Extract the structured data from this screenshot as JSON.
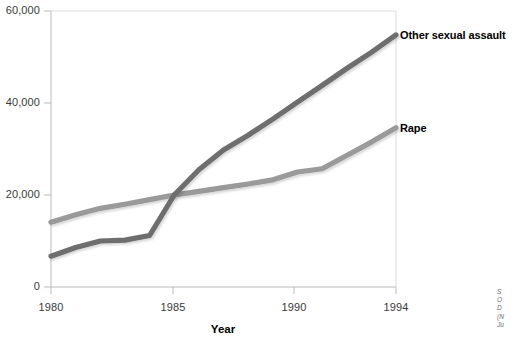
{
  "chart_data": {
    "type": "line",
    "title": "",
    "xlabel": "Year",
    "ylabel": "",
    "xlim": [
      1980,
      1994
    ],
    "ylim": [
      0,
      60000
    ],
    "grid": false,
    "legend_position": "right-inline",
    "x": [
      1980,
      1981,
      1982,
      1983,
      1984,
      1985,
      1986,
      1987,
      1988,
      1989,
      1990,
      1991,
      1992,
      1993,
      1994
    ],
    "xticks": [
      "1980",
      "1985",
      "1990",
      "1994"
    ],
    "xtick_values": [
      1980,
      1985,
      1990,
      1994
    ],
    "yticks": [
      "0",
      "20,000",
      "40,000",
      "60,000"
    ],
    "ytick_values": [
      0,
      20000,
      40000,
      60000
    ],
    "series": [
      {
        "name": "Other sexual assault",
        "color": "#6e6e6e",
        "values": [
          6700,
          8600,
          10000,
          10200,
          11200,
          20000,
          25500,
          29800,
          33000,
          36500,
          40200,
          43800,
          47500,
          51000,
          54800
        ]
      },
      {
        "name": "Rape",
        "color": "#9a9a9a",
        "values": [
          14100,
          15700,
          17100,
          18000,
          19000,
          20000,
          20800,
          21600,
          22400,
          23300,
          25000,
          25700,
          28600,
          31500,
          34600
        ]
      }
    ]
  },
  "labels": {
    "series_other_sexual_assault": "Other sexual assault",
    "series_rape": "Rape",
    "x_axis_title": "Year",
    "ytick_0": "0",
    "ytick_20000": "20,000",
    "ytick_40000": "40,000",
    "ytick_60000": "60,000",
    "xtick_1980": "1980",
    "xtick_1985": "1985",
    "xtick_1990": "1990",
    "xtick_1994": "1994"
  },
  "source_note": {
    "line1": "S",
    "line2": "O",
    "line3": "D",
    "line4": "(N",
    "line5": "Ju"
  },
  "colors": {
    "series_dark": "#6e6e6e",
    "series_light": "#9a9a9a",
    "axis": "#b9b9b9",
    "text": "#1a1a1a"
  }
}
